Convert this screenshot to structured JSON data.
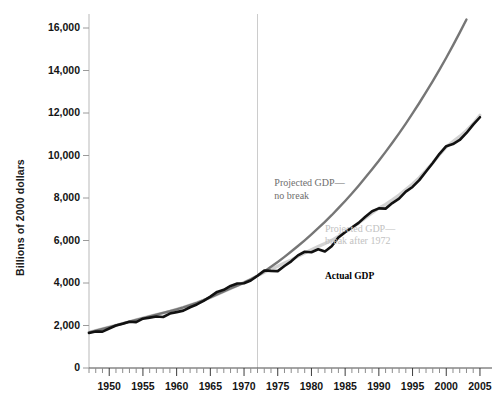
{
  "chart_data": {
    "type": "line",
    "title": "",
    "xlabel": "",
    "ylabel": "Billions of 2000 dollars",
    "xlim": [
      1947,
      2005.6
    ],
    "ylim": [
      0,
      16000
    ],
    "grid": false,
    "legend_position": "inline-annotations",
    "y_ticks": [
      "0",
      "2,000",
      "4,000",
      "6,000",
      "8,000",
      "10,000",
      "12,000",
      "14,000",
      "16,000"
    ],
    "y_tick_values": [
      0,
      2000,
      4000,
      6000,
      8000,
      10000,
      12000,
      14000,
      16000
    ],
    "x_ticks": [
      "1950",
      "1955",
      "1960",
      "1965",
      "1970",
      "1975",
      "1980",
      "1985",
      "1990",
      "1995",
      "2000",
      "2005"
    ],
    "x_tick_values": [
      1950,
      1955,
      1960,
      1965,
      1970,
      1975,
      1980,
      1985,
      1990,
      1995,
      2000,
      2005
    ],
    "x_minor_tick_interval": 1,
    "annotations": [
      {
        "name": "break-line-1972",
        "type": "vline",
        "x": 1972,
        "color": "#cccccc"
      },
      {
        "name": "label-projected-no-break",
        "text": "Projected GDP—\nno break",
        "x": 1974.5,
        "y": 8600,
        "color": "#6e6e6e"
      },
      {
        "name": "label-projected-break",
        "text": "Projected GDP—\nbreak after 1972",
        "x": 1982.0,
        "y": 6450,
        "color": "#c2c2c2"
      },
      {
        "name": "label-actual-gdp",
        "text": "Actual GDP",
        "x": 1982.0,
        "y": 4250,
        "color": "#000000"
      }
    ],
    "x": [
      1947,
      1948,
      1949,
      1950,
      1951,
      1952,
      1953,
      1954,
      1955,
      1956,
      1957,
      1958,
      1959,
      1960,
      1961,
      1962,
      1963,
      1964,
      1965,
      1966,
      1967,
      1968,
      1969,
      1970,
      1971,
      1972,
      1973,
      1974,
      1975,
      1976,
      1977,
      1978,
      1979,
      1980,
      1981,
      1982,
      1983,
      1984,
      1985,
      1986,
      1987,
      1988,
      1989,
      1990,
      1991,
      1992,
      1993,
      1994,
      1995,
      1996,
      1997,
      1998,
      1999,
      2000,
      2001,
      2002,
      2003,
      2004,
      2005
    ],
    "series": [
      {
        "name": "Actual GDP",
        "color": "#111111",
        "width": 2.6,
        "values": [
          1650,
          1720,
          1710,
          1860,
          2000,
          2080,
          2180,
          2160,
          2320,
          2370,
          2420,
          2400,
          2560,
          2630,
          2700,
          2860,
          2990,
          3160,
          3360,
          3580,
          3680,
          3860,
          3980,
          3990,
          4120,
          4340,
          4590,
          4570,
          4560,
          4800,
          5020,
          5300,
          5470,
          5450,
          5590,
          5480,
          5730,
          6140,
          6390,
          6610,
          6830,
          7120,
          7380,
          7510,
          7500,
          7760,
          7970,
          8300,
          8520,
          8840,
          9250,
          9650,
          10080,
          10440,
          10540,
          10730,
          11060,
          11450,
          11800
        ]
      },
      {
        "name": "Projected GDP—break after 1972",
        "color": "#d2d2d2",
        "width": 3.2,
        "values": [
          1680,
          1760,
          1840,
          1925,
          2010,
          2095,
          2180,
          2265,
          2350,
          2430,
          2510,
          2590,
          2670,
          2760,
          2855,
          2960,
          3070,
          3190,
          3320,
          3460,
          3600,
          3740,
          3880,
          4020,
          4170,
          4340,
          4500,
          4650,
          4790,
          4940,
          5090,
          5250,
          5410,
          5570,
          5720,
          5860,
          6010,
          6200,
          6400,
          6600,
          6820,
          7060,
          7300,
          7520,
          7700,
          7910,
          8140,
          8400,
          8660,
          8960,
          9300,
          9660,
          10040,
          10400,
          10660,
          10900,
          11180,
          11500,
          11900
        ]
      },
      {
        "name": "Projected GDP—no break",
        "color": "#767676",
        "width": 2.4,
        "values": [
          1680,
          1760,
          1840,
          1925,
          2010,
          2095,
          2180,
          2265,
          2350,
          2430,
          2510,
          2590,
          2670,
          2760,
          2855,
          2960,
          3070,
          3190,
          3320,
          3460,
          3600,
          3740,
          3880,
          4020,
          4170,
          4340,
          4540,
          4760,
          4990,
          5230,
          5480,
          5740,
          6010,
          6290,
          6580,
          6880,
          7190,
          7520,
          7860,
          8210,
          8580,
          8960,
          9350,
          9750,
          10170,
          10600,
          11040,
          11500,
          11980,
          12470,
          12980,
          13500,
          14040,
          14600,
          15180,
          15780,
          16400,
          17050,
          17700
        ]
      }
    ],
    "series_display": [
      {
        "name": "Projected GDP—no break",
        "color": "#767676"
      },
      {
        "name": "Projected GDP—break after 1972",
        "color": "#d2d2d2"
      },
      {
        "name": "Actual GDP",
        "color": "#111111"
      }
    ]
  }
}
